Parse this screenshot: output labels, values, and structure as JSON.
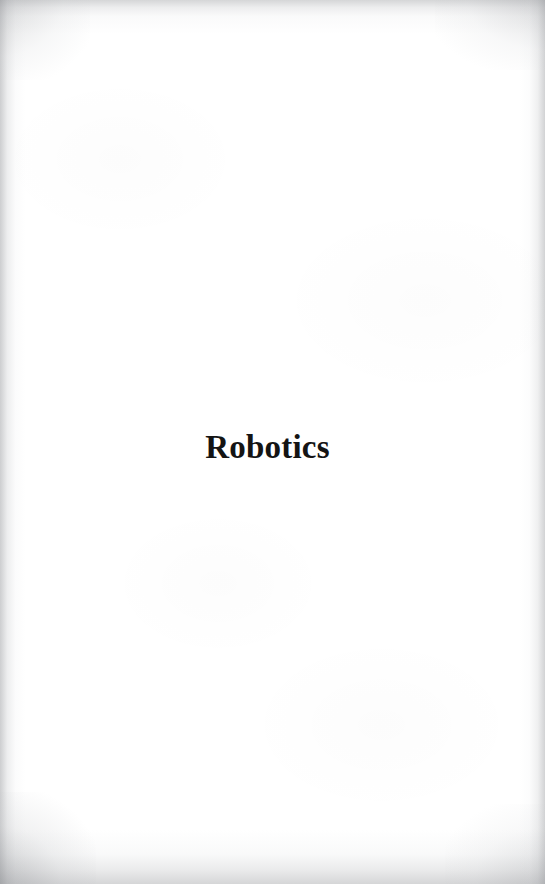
{
  "page": {
    "kind": "scanned-book-part-title-page",
    "background_color": "#ffffff",
    "edge_shadow_color": "#9b9da0",
    "width": 545,
    "height": 884
  },
  "content": {
    "part_title": "Robotics",
    "title_color": "#141414"
  }
}
